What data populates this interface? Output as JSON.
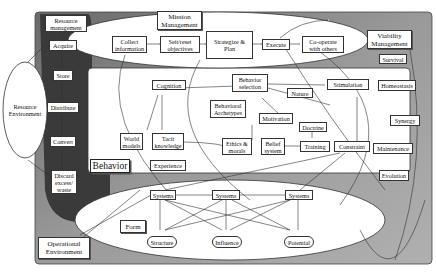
{
  "diagram": {
    "colors": {
      "outer_bg": "#8a8a8a",
      "dark_column": "#3c3c3c",
      "white_region": "#ffffff",
      "line": "#333333"
    },
    "environments": {
      "resource": "Resource\nEnvironment",
      "operational": "Operational\nEnvironment"
    },
    "sections": {
      "mission": "Mission\nManagement",
      "viability": "Viability\nManagement",
      "resource_mgmt": "Resource\nmanagement",
      "behavior": "Behavior",
      "form": "Form"
    },
    "resource_chain": [
      "Acquire",
      "Store",
      "Distribute",
      "Convert",
      "Discard\nexcess/\nwaste"
    ],
    "mission_chain": [
      "Collect\ninformation",
      "Seit/reset\nobjectives",
      "Strategize &\nPlan",
      "Execute",
      "Co-operate\nwith others"
    ],
    "viability_items": [
      "Survival",
      "Homeostasis",
      "Synergy",
      "Maintenance",
      "Evolution"
    ],
    "behavior_nodes": {
      "cognition": "Cognition",
      "behavior_selection": "Behavior\nselection",
      "behavioral_archetypes": "Behavioral\nArchetypes",
      "nature": "Nature",
      "stimulation": "Stimulation",
      "motivation": "Motivation",
      "doctrine": "Doctrine",
      "world_models": "World\nmodels",
      "tacit_knowledge": "Tacit\nknowledge",
      "ethics_morals": "Ethics &\nmorals",
      "belief_system": "Belief\nsystem",
      "training": "Training",
      "constraint": "Constraint",
      "experience": "Experience"
    },
    "form_nodes": {
      "systems": [
        "Systems",
        "Systems",
        "Systems"
      ],
      "bottom": [
        "Structure",
        "Influence",
        "Potential"
      ]
    }
  }
}
